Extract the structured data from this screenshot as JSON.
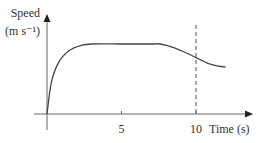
{
  "chart_data": {
    "type": "line",
    "title": "",
    "xlabel": "Time (s)",
    "ylabel": "Speed",
    "ylabel_units": "(m s⁻¹)",
    "xlim": [
      0,
      13.5
    ],
    "ylim": [
      0,
      10
    ],
    "x_ticks": [
      5,
      10
    ],
    "x_tick_labels": [
      "5",
      "10"
    ],
    "y_ticks": [],
    "grid": false,
    "legend": "none",
    "series": [
      {
        "name": "speed",
        "description": "rapid rise from 0, constant plateau, then smooth decrease",
        "x": [
          0,
          0.3,
          0.8,
          1.5,
          2.3,
          3.0,
          5.0,
          7.0,
          7.6,
          8.5,
          9.5,
          10.0,
          10.8,
          11.5,
          12.0
        ],
        "y": [
          0,
          4.5,
          7.3,
          8.9,
          9.6,
          9.8,
          9.8,
          9.8,
          9.8,
          9.3,
          8.4,
          7.9,
          7.1,
          6.7,
          6.6
        ]
      }
    ],
    "annotations": [
      {
        "type": "vertical-dashed-line",
        "x": 10
      }
    ]
  }
}
